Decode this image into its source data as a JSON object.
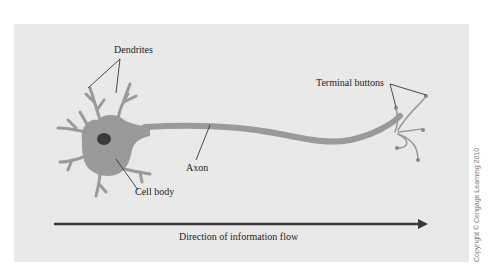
{
  "diagram": {
    "labels": {
      "dendrites": "Dendrites",
      "cell_body": "Cell body",
      "axon": "Axon",
      "terminal_buttons": "Terminal buttons",
      "flow": "Direction of information flow"
    },
    "copyright": "Copyright © Cengage Learning 2010",
    "colors": {
      "background_panel": "#e9e9e9",
      "neuron": "#9a9a9a",
      "nucleus": "#3a3a3a",
      "arrow": "#3a3a3a",
      "leader_lines": "#222222"
    }
  }
}
